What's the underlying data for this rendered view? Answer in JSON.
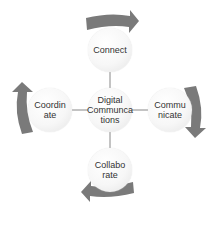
{
  "diagram": {
    "type": "radial-cycle",
    "center": {
      "label": "Digital\nCommunca\ntions"
    },
    "nodes": [
      {
        "id": "top",
        "label": "Connect"
      },
      {
        "id": "right",
        "label": "Commu\nnicate"
      },
      {
        "id": "bottom",
        "label": "Collabo\nrate"
      },
      {
        "id": "left",
        "label": "Coordin\nate"
      }
    ],
    "arrows": [
      {
        "position": "top",
        "direction": "right"
      },
      {
        "position": "right",
        "direction": "down"
      },
      {
        "position": "bottom",
        "direction": "left"
      },
      {
        "position": "left",
        "direction": "up"
      }
    ],
    "colors": {
      "arrow": "#7a7a7a",
      "circle": "#f5f5f5",
      "connector": "#888888",
      "text": "#333333"
    }
  }
}
